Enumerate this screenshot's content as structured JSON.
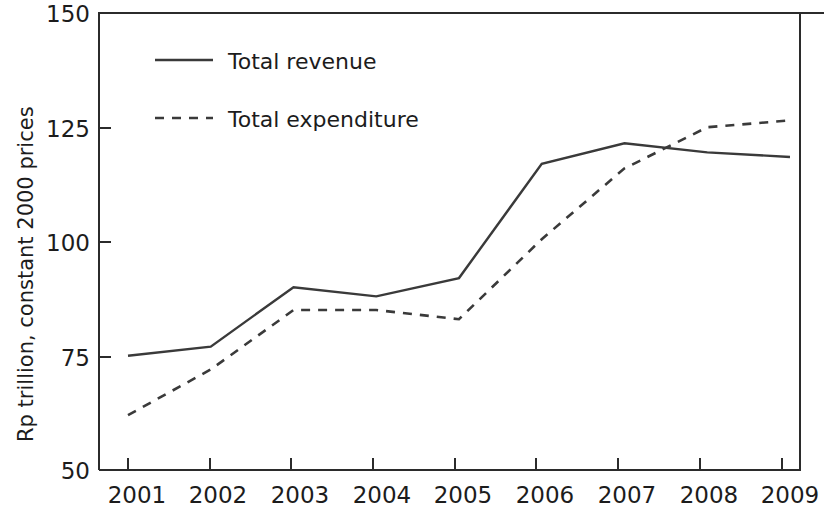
{
  "chart_data": {
    "type": "line",
    "title": "",
    "xlabel": "",
    "ylabel": "Rp trillion, constant 2000 prices",
    "categories": [
      "2001",
      "2002",
      "2003",
      "2004",
      "2005",
      "2006",
      "2007",
      "2008",
      "2009"
    ],
    "x_tick_labels": [
      "2001",
      "2002",
      "2003",
      "2004",
      "2005",
      "2006",
      "2007",
      "2008",
      "2009"
    ],
    "y_tick_labels": [
      "50",
      "75",
      "100",
      "125",
      "150"
    ],
    "y_ticks": [
      50,
      75,
      100,
      125,
      150
    ],
    "ylim": [
      50,
      150
    ],
    "grid": false,
    "legend_position": "upper left",
    "series": [
      {
        "name": "Total revenue",
        "style": "solid",
        "color": "#3a3a3a",
        "values": [
          75,
          77,
          90,
          88,
          92,
          117,
          121.5,
          119.5,
          118.5
        ]
      },
      {
        "name": "Total expenditure",
        "style": "dashed",
        "color": "#3a3a3a",
        "values": [
          62,
          72,
          85,
          85,
          83,
          100.5,
          116,
          125,
          126.5
        ]
      }
    ]
  },
  "legend": {
    "items": [
      {
        "label": "Total revenue",
        "style": "solid"
      },
      {
        "label": "Total expenditure",
        "style": "dashed"
      }
    ]
  },
  "axes": {
    "y_axis_title": "Rp trillion, constant 2000 prices"
  }
}
